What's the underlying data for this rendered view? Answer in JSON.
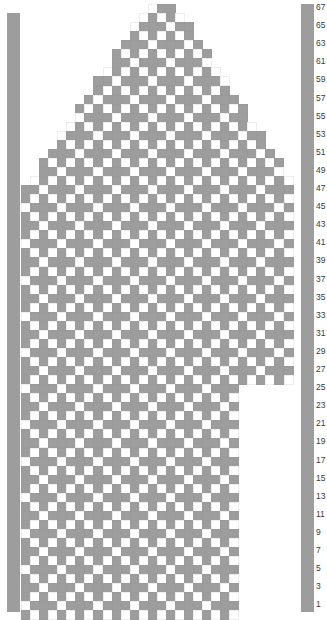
{
  "chart_title": "Colorwork Knitting Chart",
  "colors": {
    "filled": "#9d9d9d",
    "empty": "#ffffff",
    "gridline": "#ededed",
    "selvedge": "#9d9d9d",
    "label_text": "#3a3a3a"
  },
  "geometry": {
    "cell": 9.05,
    "grid_left": 21,
    "grid_top": 4,
    "columns": 30,
    "rows": 68,
    "selvedge_left_x": 7,
    "selvedge_left_top": 13,
    "selvedge_left_width": 13,
    "selvedge_right_x": 301,
    "selvedge_right_top": 4,
    "selvedge_right_width": 13,
    "selvedge_bottom": 612,
    "label_x": 316
  },
  "row_labels": [
    {
      "value": "67",
      "row": 1
    },
    {
      "value": "65",
      "row": 3
    },
    {
      "value": "63",
      "row": 5
    },
    {
      "value": "61",
      "row": 7
    },
    {
      "value": "59",
      "row": 9
    },
    {
      "value": "57",
      "row": 11
    },
    {
      "value": "55",
      "row": 13
    },
    {
      "value": "53",
      "row": 15
    },
    {
      "value": "51",
      "row": 17
    },
    {
      "value": "49",
      "row": 19
    },
    {
      "value": "47",
      "row": 21
    },
    {
      "value": "45",
      "row": 23
    },
    {
      "value": "43",
      "row": 25
    },
    {
      "value": "41",
      "row": 27
    },
    {
      "value": "39",
      "row": 29
    },
    {
      "value": "37",
      "row": 31
    },
    {
      "value": "35",
      "row": 33
    },
    {
      "value": "33",
      "row": 35
    },
    {
      "value": "31",
      "row": 37
    },
    {
      "value": "29",
      "row": 39
    },
    {
      "value": "27",
      "row": 41
    },
    {
      "value": "25",
      "row": 43
    },
    {
      "value": "23",
      "row": 45
    },
    {
      "value": "21",
      "row": 47
    },
    {
      "value": "19",
      "row": 49
    },
    {
      "value": "17",
      "row": 51
    },
    {
      "value": "15",
      "row": 53
    },
    {
      "value": "13",
      "row": 55
    },
    {
      "value": "11",
      "row": 57
    },
    {
      "value": "9",
      "row": 59
    },
    {
      "value": "7",
      "row": 61
    },
    {
      "value": "5",
      "row": 63
    },
    {
      "value": "3",
      "row": 65
    },
    {
      "value": "1",
      "row": 67
    }
  ],
  "chart_data": {
    "type": "heatmap",
    "xlabel": "",
    "ylabel": "Row",
    "columns": 30,
    "rows": 68,
    "legend": [
      {
        "label": "main colour (blank)",
        "color": "#ffffff"
      },
      {
        "label": "contrast colour (filled)",
        "color": "#9d9d9d"
      }
    ],
    "row_numbering": "odd rows labelled 67 down to 1, right side",
    "shape_note": "sloped shoulders at top widening 1 stitch per row each side; right-side notch from row 27 upward region",
    "row_extent": [
      [
        14,
        16
      ],
      [
        13,
        17
      ],
      [
        12,
        18
      ],
      [
        12,
        18
      ],
      [
        11,
        19
      ],
      [
        10,
        20
      ],
      [
        10,
        20
      ],
      [
        9,
        21
      ],
      [
        8,
        22
      ],
      [
        8,
        22
      ],
      [
        7,
        23
      ],
      [
        6,
        24
      ],
      [
        6,
        24
      ],
      [
        5,
        25
      ],
      [
        4,
        26
      ],
      [
        4,
        26
      ],
      [
        3,
        27
      ],
      [
        2,
        28
      ],
      [
        2,
        28
      ],
      [
        1,
        29
      ],
      [
        0,
        29
      ],
      [
        0,
        29
      ],
      [
        0,
        29
      ],
      [
        0,
        29
      ],
      [
        0,
        29
      ],
      [
        0,
        29
      ],
      [
        0,
        29
      ],
      [
        0,
        29
      ],
      [
        0,
        29
      ],
      [
        0,
        29
      ],
      [
        0,
        29
      ],
      [
        0,
        29
      ],
      [
        0,
        29
      ],
      [
        0,
        29
      ],
      [
        0,
        29
      ],
      [
        0,
        29
      ],
      [
        0,
        29
      ],
      [
        0,
        29
      ],
      [
        0,
        29
      ],
      [
        0,
        29
      ],
      [
        0,
        29
      ],
      [
        0,
        29
      ],
      [
        0,
        23
      ],
      [
        0,
        23
      ],
      [
        0,
        23
      ],
      [
        0,
        23
      ],
      [
        0,
        23
      ],
      [
        0,
        23
      ],
      [
        0,
        23
      ],
      [
        0,
        23
      ],
      [
        0,
        23
      ],
      [
        0,
        23
      ],
      [
        0,
        23
      ],
      [
        0,
        23
      ],
      [
        0,
        23
      ],
      [
        0,
        23
      ],
      [
        0,
        23
      ],
      [
        0,
        23
      ],
      [
        0,
        23
      ],
      [
        0,
        23
      ],
      [
        0,
        23
      ],
      [
        0,
        23
      ],
      [
        0,
        23
      ],
      [
        0,
        23
      ],
      [
        0,
        23
      ],
      [
        0,
        23
      ],
      [
        0,
        23
      ],
      [
        0,
        23
      ]
    ],
    "pattern_description": "repeating 5-stitch plus/cross motifs arranged on a diagonal lattice with 4-stitch, 4-row offset repeat",
    "motif": {
      "type": "plus",
      "arm": 1,
      "offset_x": 4,
      "offset_y": 4
    }
  }
}
